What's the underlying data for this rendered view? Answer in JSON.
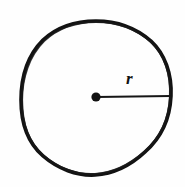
{
  "figure": {
    "name": "circle-with-radius",
    "caption": "",
    "background_color": "#fefefe",
    "ink_color": "#111111"
  },
  "labels": {
    "radius": "r"
  },
  "geometry": {
    "circle": {
      "center_x": 96,
      "center_y": 97,
      "radius_x": 75,
      "radius_y": 76,
      "stroke_width": 3.6
    },
    "center_dot": {
      "x": 96,
      "y": 97,
      "diameter": 9
    },
    "radius_line": {
      "x1": 96,
      "y1": 97,
      "x2": 171,
      "y2": 96,
      "stroke_width": 1.7
    }
  }
}
